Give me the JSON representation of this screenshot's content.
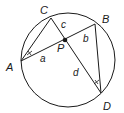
{
  "diagram": {
    "type": "intersecting-chords-circle",
    "circle": {
      "cx": 68,
      "cy": 60,
      "r": 47
    },
    "points": {
      "A": {
        "x": 21,
        "y": 61,
        "label": "A"
      },
      "B": {
        "x": 95,
        "y": 24,
        "label": "B"
      },
      "C": {
        "x": 51,
        "y": 18,
        "label": "C"
      },
      "D": {
        "x": 101,
        "y": 93,
        "label": "D"
      },
      "P": {
        "x": 65,
        "y": 40,
        "label": "P"
      }
    },
    "segment_labels": {
      "a": "a",
      "b": "b",
      "c": "c",
      "d": "d"
    },
    "stroke_color": "#1a1a1a"
  }
}
